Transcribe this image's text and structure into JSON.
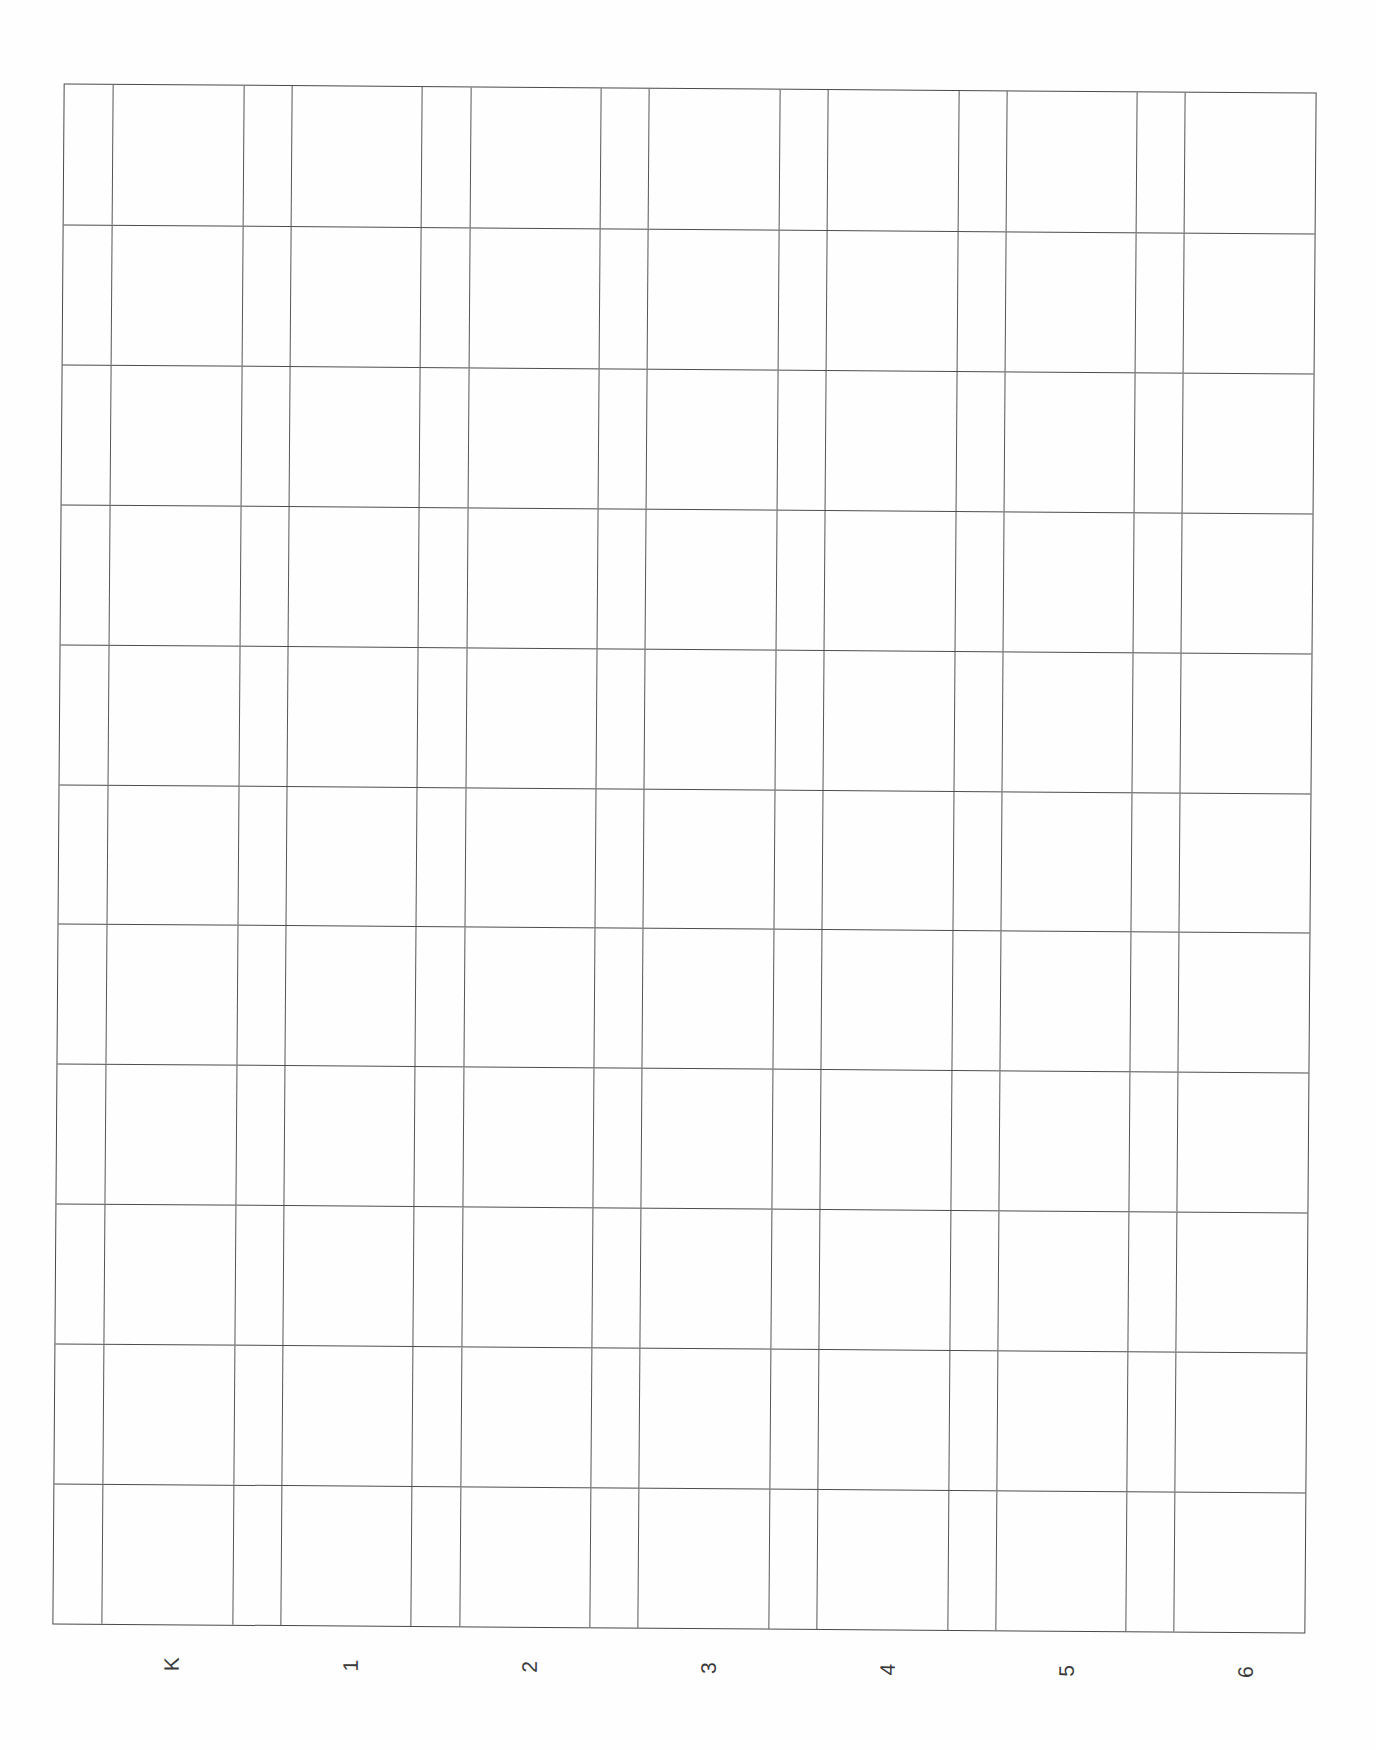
{
  "document": {
    "type": "blank grid worksheet (scanned, rotated labels)",
    "rows": 11,
    "column_groups": 7,
    "line_color": "#4d4d4d",
    "background": "#ffffff"
  },
  "columns": [
    {
      "label": "K"
    },
    {
      "label": "1"
    },
    {
      "label": "2"
    },
    {
      "label": "3"
    },
    {
      "label": "4"
    },
    {
      "label": "5"
    },
    {
      "label": "6"
    }
  ]
}
